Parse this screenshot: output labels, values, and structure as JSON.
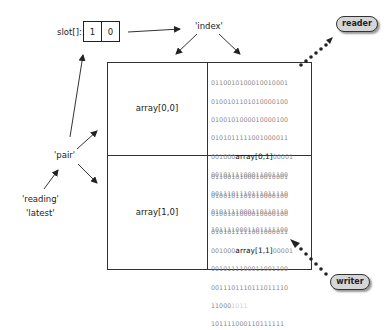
{
  "slot": {
    "label": "slot[]:",
    "values": [
      "1",
      "0"
    ]
  },
  "labels": {
    "index": "'index'",
    "pair": "'pair'",
    "reading": "'reading'",
    "latest": "'latest'"
  },
  "cells": {
    "a00": "array[0,0]",
    "a10": "array[1,0]"
  },
  "bits_top": {
    "lines": [
      "01100101000100100 01",
      "01001011010100001 00",
      "01001010000100001 00",
      "01010111110010000 11"
    ],
    "l5_pre": "001000",
    "l5_hl": "array[0,1]",
    "l5_post": "00001",
    "l6": "00101111000110011 00",
    "l7": "00111011101110111 10",
    "l8": "01011110001101101 10",
    "l9": "10111100011011111 00"
  },
  "bits_bottom": {
    "l1": "01100101000100100 01",
    "l2": "01001011010100001 00",
    "l3": "01001010000100001 00",
    "l4": "01010111110010000 11",
    "l5_pre": "001000",
    "l5_hl": "array[1,1]",
    "l5_post": "00001",
    "l6": "00101111000110011 00",
    "l7": "00111011101110111 10",
    "l8_pre": "11000",
    "l8_faint": "1011",
    "l9": "10111100011011111 1"
  },
  "actors": {
    "reader": "reader",
    "writer": "writer"
  }
}
